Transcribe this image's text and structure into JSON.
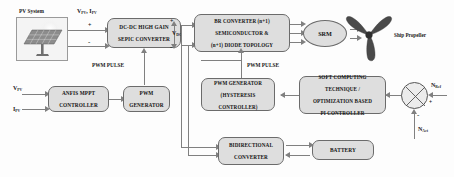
{
  "diagram": {
    "blocks": {
      "pv_system": {
        "label": "PV System",
        "icon": "solar-panel-icon"
      },
      "sepic": {
        "line1": "DC-DC HIGH GAIN",
        "line2": "SEPIC CONVERTER"
      },
      "br_converter": {
        "line1": "BR CONVERTER (n+1)",
        "line2": "SEMICONDUCTOR &",
        "line3": "(n+1) DIODE TOPOLOGY"
      },
      "srm": {
        "label": "SRM"
      },
      "ship_propeller": {
        "label": "Ship Propeller",
        "icon": "propeller-icon"
      },
      "anfis": {
        "line1": "ANFIS MPPT",
        "line2": "CONTROLLER"
      },
      "pwm_generator": {
        "line1": "PWM",
        "line2": "GENERATOR"
      },
      "pwm_hysteresis": {
        "line1": "PWM GENERATOR",
        "line2": "(HYSTERESIS",
        "line3": "CONTROLLER)"
      },
      "soft_computing": {
        "line1": "SOFT COMPUTING",
        "line2": "TECHNIQUE /",
        "line3": "OPTIMIZATION BASED",
        "line4": "PI CONTROLLER"
      },
      "bidirectional": {
        "line1": "BIDIRECTIONAL",
        "line2": "CONVERTER"
      },
      "battery": {
        "label": "BATTERY"
      }
    },
    "signals": {
      "pv_out": {
        "base": "V",
        "sub": "PV",
        "base2": "I",
        "sub2": "PV",
        "text": "V PV , I PV"
      },
      "vdc": {
        "base": "V",
        "sub": "DC"
      },
      "v_pv_in": {
        "base": "V",
        "sub": "PV"
      },
      "i_pv_in": {
        "base": "I",
        "sub": "PV"
      },
      "n_ref": {
        "base": "N",
        "sub": "Ref"
      },
      "n_act": {
        "base": "N",
        "sub": "Act"
      },
      "pwm_pulse_left": "PWM PULSE",
      "pwm_pulse_right": "PWM PULSE",
      "plus": "+",
      "minus": "-"
    },
    "colors": {
      "block_fill": "#dedede",
      "block_border": "#6b6b6b",
      "wire": "#808080",
      "text": "#141414",
      "propeller": "#4a4a4a",
      "background": "#fdfdfd"
    }
  }
}
